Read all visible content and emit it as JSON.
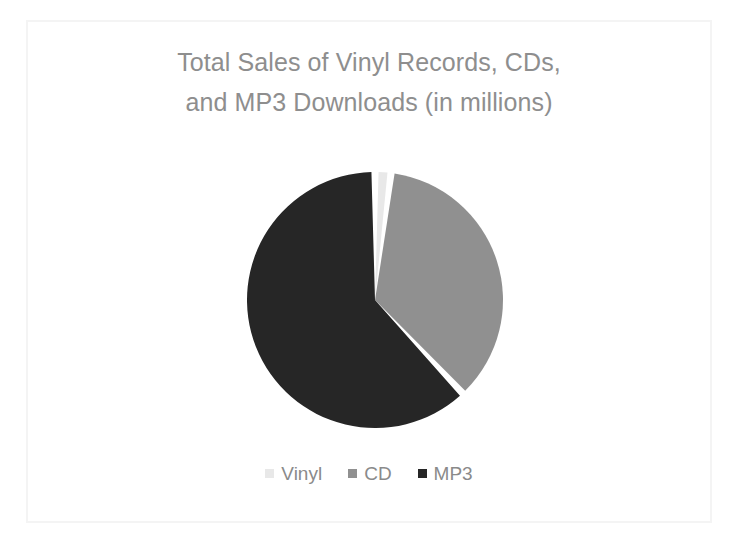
{
  "slide": {
    "background_color": "#ffffff",
    "frame_color": "#f4f4f4"
  },
  "chart_data": {
    "type": "pie",
    "title": "Total Sales of Vinyl Records, CDs, and MP3 Downloads (in millions)",
    "title_lines": [
      "Total Sales of Vinyl Records, CDs,",
      "and MP3 Downloads (in millions)"
    ],
    "title_color": "#8e8e8e",
    "units": "millions",
    "categories": [
      "Vinyl",
      "CD",
      "MP3"
    ],
    "values": [
      2,
      36,
      62
    ],
    "percentages": [
      2,
      36,
      62
    ],
    "colors": [
      "#e8e8e8",
      "#909090",
      "#262626"
    ],
    "start_angle_deg": 0,
    "direction": "clockwise",
    "slice_angles_deg": [
      8,
      130,
      222
    ],
    "separator_color": "#ffffff",
    "legend_position": "bottom",
    "labels_shown": false,
    "grid": false,
    "series": [
      {
        "name": "Total Sales",
        "values": [
          2,
          36,
          62
        ]
      }
    ]
  },
  "legend": {
    "items": [
      {
        "label": "Vinyl",
        "color": "#e8e8e8"
      },
      {
        "label": "CD",
        "color": "#909090"
      },
      {
        "label": "MP3",
        "color": "#262626"
      }
    ],
    "text_color": "#8a8a8a"
  }
}
